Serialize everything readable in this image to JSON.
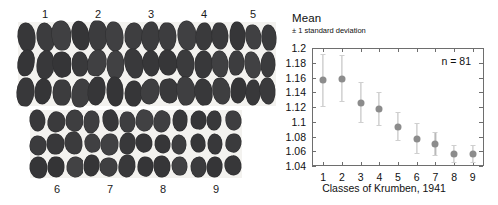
{
  "photo": {
    "top_row_labels": [
      "1",
      "2",
      "3",
      "4",
      "5"
    ],
    "bottom_row_labels": [
      "6",
      "7",
      "8",
      "9"
    ],
    "pebble_color": "#3a3a3c",
    "background_color": "#f3f2ef",
    "pebbles_per_class": 9,
    "grid": "3x3"
  },
  "chart_data": {
    "type": "scatter",
    "title": "Mean",
    "subtitle": "± 1 standard deviation",
    "xlabel": "Classes of Krumben, 1941",
    "ylabel": "",
    "annotation": "n = 81",
    "categories": [
      "1",
      "2",
      "3",
      "4",
      "5",
      "6",
      "7",
      "8",
      "9"
    ],
    "x": [
      1,
      2,
      3,
      4,
      5,
      6,
      7,
      8,
      9
    ],
    "values": [
      1.156,
      1.158,
      1.125,
      1.117,
      1.093,
      1.077,
      1.07,
      1.056,
      1.056
    ],
    "err_low": [
      1.121,
      1.128,
      1.099,
      1.096,
      1.075,
      1.058,
      1.055,
      1.046,
      1.046
    ],
    "err_high": [
      1.192,
      1.191,
      1.154,
      1.14,
      1.113,
      1.098,
      1.086,
      1.068,
      1.068
    ],
    "ylim": [
      1.04,
      1.2
    ],
    "xlim": [
      0.4,
      9.6
    ],
    "yticks": [
      1.2,
      1.18,
      1.16,
      1.14,
      1.12,
      1.1,
      1.08,
      1.06,
      1.04
    ],
    "ytick_labels": [
      "1.2",
      "1.18",
      "1.16",
      "1.14",
      "1.12",
      "1.1",
      "1.08",
      "1.06",
      "1.04"
    ],
    "xticks": [
      1,
      2,
      3,
      4,
      5,
      6,
      7,
      8,
      9
    ],
    "xtick_labels": [
      "1",
      "2",
      "3",
      "4",
      "5",
      "6",
      "7",
      "8",
      "9"
    ],
    "grid": false,
    "legend": null,
    "marker_color": "#8c8c8c",
    "errorbar_color": "#b9b9b9",
    "axis_color": "#6e6e6e"
  }
}
